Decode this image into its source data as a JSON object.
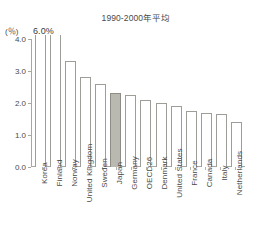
{
  "header": {
    "clipped_fragment": "— — —— — —— ——— —— —"
  },
  "chart_data": {
    "type": "bar",
    "title": "",
    "subtitle": "1990-2000年平均",
    "unit_label": "(％)",
    "xlabel": "",
    "ylabel": "",
    "ylim": [
      0.0,
      4.0
    ],
    "grid": false,
    "legend": "none",
    "peak_annotation": "6.0%",
    "highlight_category": "Japan",
    "highlight_color": "#b9b9b1",
    "bar_outline_color": "#9e9e98",
    "axis_color": "#a8a8a2",
    "ytick_labels": [
      "4.0",
      "3.0",
      "2.0",
      "1.0",
      "0.0"
    ],
    "ytick_values": [
      4.0,
      3.0,
      2.0,
      1.0,
      0.0
    ],
    "categories": [
      "Korea",
      "Finland",
      "Norway",
      "United Kingdom",
      "Sweden",
      "Japan",
      "Germany",
      "OECD26",
      "Denmark",
      "United States",
      "France",
      "Canada",
      "Italy",
      "Netherlands"
    ],
    "values": [
      6.0,
      4.6,
      3.3,
      2.8,
      2.6,
      2.3,
      2.25,
      2.1,
      2.0,
      1.9,
      1.75,
      1.7,
      1.65,
      1.4
    ],
    "clipped_bars": [
      "Korea",
      "Finland"
    ]
  }
}
